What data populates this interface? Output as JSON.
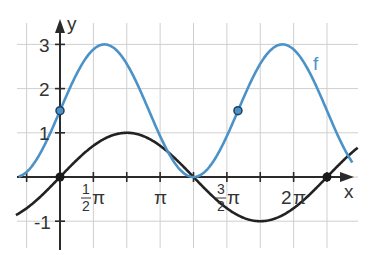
{
  "chart_data": {
    "type": "line",
    "title": "",
    "xlabel": "x",
    "ylabel": "y",
    "x_unit": "pi",
    "xlim": [
      -0.33,
      2.95
    ],
    "ylim": [
      -1.2,
      3.3
    ],
    "grid": true,
    "grid_step_x": 0.25,
    "grid_step_y": 1,
    "x_tick_labels": [
      {
        "text_num": "1",
        "text_den": "2",
        "text_sym": "π",
        "px": 93
      },
      {
        "text_sym": "π",
        "px": 160
      },
      {
        "text_num": "3",
        "text_den": "2",
        "text_sym": "π",
        "px": 228
      },
      {
        "text_pre": "2",
        "text_sym": "π",
        "px": 293
      }
    ],
    "y_tick_labels": [
      "3",
      "2",
      "1",
      "-1"
    ],
    "series": [
      {
        "name": "f",
        "formula": "1.5*sin(1.5x)+1.5",
        "color": "#4a92c8",
        "label": "f",
        "points": [
          [
            0,
            1.5
          ],
          [
            0.333,
            3
          ],
          [
            1,
            0
          ],
          [
            1.333,
            1.5
          ],
          [
            1.667,
            3
          ]
        ],
        "marked_points": [
          [
            0,
            1.5
          ],
          [
            1.333,
            1.5
          ]
        ]
      },
      {
        "name": "g",
        "formula": "sin(x)",
        "color": "#222222",
        "label": "",
        "points": [
          [
            0,
            0
          ],
          [
            0.5,
            1
          ],
          [
            1,
            0
          ],
          [
            1.5,
            -1
          ],
          [
            2,
            0
          ]
        ],
        "marked_points": [
          [
            0,
            0
          ],
          [
            2,
            0
          ]
        ]
      }
    ],
    "legend": "inline label 'f' near blue curve"
  },
  "labels": {
    "x_axis": "x",
    "y_axis": "y",
    "f": "f",
    "y3": "3",
    "y2": "2",
    "y1": "1",
    "ym1": "-1",
    "half": "1",
    "two": "2",
    "three": "3",
    "pi": "π",
    "twopi_pre": "2"
  }
}
